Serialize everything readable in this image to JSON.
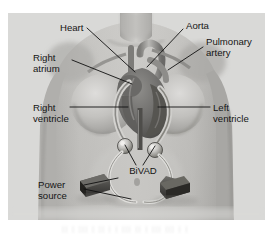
{
  "figure": {
    "type": "medical-illustration",
    "style": "grayscale anatomical drawing of a human torso, front view",
    "background_color": "#d9d9d7",
    "page_color": "#ffffff",
    "label_color": "#151515",
    "leader_color": "#101010",
    "panel": {
      "x": 8,
      "y": 13,
      "width": 257,
      "height": 207
    }
  },
  "labels": [
    {
      "id": "heart",
      "text": "Heart",
      "lines": [
        "Heart"
      ],
      "anchor": "start",
      "x": 60,
      "y": 31,
      "leader": "M 87 28 L 135 72"
    },
    {
      "id": "aorta",
      "text": "Aorta",
      "lines": [
        "Aorta"
      ],
      "anchor": "start",
      "x": 186,
      "y": 29,
      "leader": "M 183 29 L 147 67"
    },
    {
      "id": "pulmonary-artery",
      "text": "Pulmonary artery",
      "lines": [
        "Pulmonary",
        "artery"
      ],
      "anchor": "start",
      "x": 206,
      "y": 45,
      "leader": "M 203 47 L 168 70"
    },
    {
      "id": "right-atrium",
      "text": "Right atrium",
      "lines": [
        "Right",
        "atrium"
      ],
      "anchor": "start",
      "x": 33,
      "y": 61,
      "leader": "M 72 60 L 132 84"
    },
    {
      "id": "right-ventricle",
      "text": "Right ventricle",
      "lines": [
        "Right",
        "ventricle"
      ],
      "anchor": "start",
      "x": 33,
      "y": 111,
      "leader": "M 70 107 L 128 107"
    },
    {
      "id": "left-ventricle",
      "text": "Left ventricle",
      "lines": [
        "Left",
        "ventricle"
      ],
      "anchor": "start",
      "x": 213,
      "y": 111,
      "leader": "M 210 107 L 158 107"
    },
    {
      "id": "bivad",
      "text": "BiVAD",
      "lines": [
        "BiVAD"
      ],
      "anchor": "middle",
      "x": 143,
      "y": 174,
      "leaders": [
        "M 136 165 L 125 145",
        "M 143 165 L 155 146"
      ]
    },
    {
      "id": "power-source",
      "text": "Power source",
      "lines": [
        "Power",
        "source"
      ],
      "anchor": "start",
      "x": 38,
      "y": 188,
      "leaders": [
        "M 84 185 L 118 178",
        "M 84 189 L 131 199"
      ]
    }
  ],
  "anatomy": {
    "parts": [
      {
        "id": "torso",
        "name": "Human torso, front view"
      },
      {
        "id": "heart-organ",
        "name": "Heart with great vessels"
      },
      {
        "id": "aorta-vessel",
        "name": "Aorta"
      },
      {
        "id": "pulmonary-artery-vessel",
        "name": "Pulmonary artery"
      },
      {
        "id": "right-atrium-chamber",
        "name": "Right atrium"
      },
      {
        "id": "right-ventricle-chamber",
        "name": "Right ventricle"
      },
      {
        "id": "left-ventricle-chamber",
        "name": "Left ventricle"
      }
    ]
  },
  "devices": {
    "pumps": [
      {
        "id": "pump-left",
        "name": "BiVAD pump (right-side cannula)"
      },
      {
        "id": "pump-right",
        "name": "BiVAD pump (left-side cannula)"
      }
    ],
    "battery_packs": [
      {
        "id": "battery-left",
        "name": "Power source battery pack (left)"
      },
      {
        "id": "battery-right",
        "name": "Power source battery pack (right)"
      }
    ],
    "driveline_count": 2
  },
  "caption_ghost": "|| | ||| | || | | ||| || | ||| ||| | |"
}
